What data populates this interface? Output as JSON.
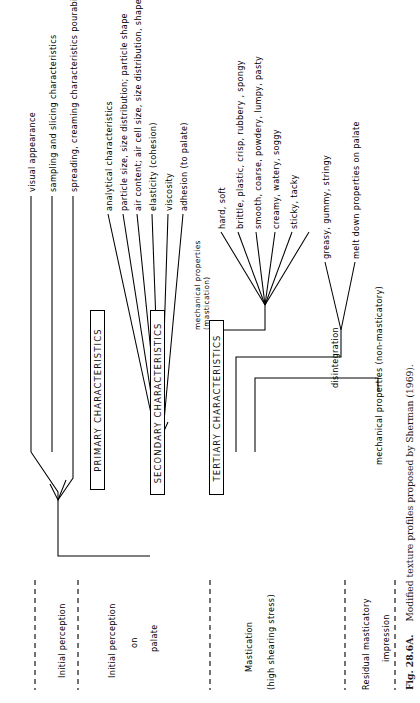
{
  "figure": {
    "caption_number": "Fig. 28.6A.",
    "caption_text": "Modified texture profiles proposed by Sherman (1969)."
  },
  "primary": {
    "box_label": "PRIMARY CHARACTERISTICS",
    "attributes": [
      "visual appearance",
      "sampling and slicing characteristics",
      "spreading, creaming characteristics  pourability"
    ]
  },
  "secondary": {
    "box_label": "SECONDARY CHARACTERISTICS",
    "group_label": "analytical characteristics",
    "attributes": [
      "particle size, size distribution; particle shape",
      "air content; air cell size, size distribution, shape",
      "elasticity (cohesion)",
      "viscosity",
      "adhesion (to palate)"
    ]
  },
  "tertiary": {
    "box_label": "TERTIARY CHARACTERISTICS",
    "mechanical_mastication_label": "mechanical properties\n(mastication)",
    "mechanical_mastication_line1": "mechanical properties",
    "mechanical_mastication_line2": "(mastication)",
    "mastication_attributes": [
      "hard, soft",
      "brittle, plastic, crisp, rubbery , spongy",
      "smooth, coarse, powdery, lumpy, pasty",
      "creamy, watery, soggy",
      "sticky, tacky"
    ],
    "disintegration_label": "disintegration",
    "disintegration_attributes": [
      "greasy, gummy, stringy",
      "melt down properties on palate"
    ],
    "non_masticatory_label": "mechanical properties (non-masticatory)"
  },
  "stages": [
    {
      "id": "initial-perception",
      "lines": [
        "Initial perception"
      ]
    },
    {
      "id": "initial-perception-on-palate",
      "lines": [
        "Initial perception",
        "on",
        "palate"
      ]
    },
    {
      "id": "mastication",
      "lines": [
        "Mastication",
        "(high shearing stress)"
      ]
    },
    {
      "id": "residual-masticatory-impression",
      "lines": [
        "Residual masticatory",
        "impression"
      ]
    }
  ],
  "colors": {
    "ink": "#000000",
    "paper": "#ffffff",
    "caption_ink": "#1a1a1a"
  }
}
